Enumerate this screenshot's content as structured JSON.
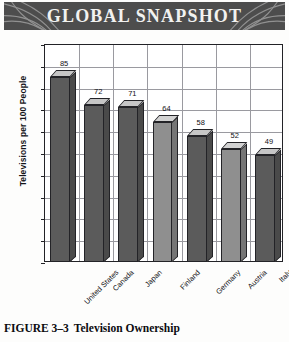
{
  "banner": {
    "title": "GLOBAL SNAPSHOT",
    "background_color": "#4d4d4d",
    "text_color": "#f2f2f0",
    "ornament": "swoosh-arcs"
  },
  "caption": {
    "number": "FIGURE 3–3",
    "title": "Television Ownership"
  },
  "chart_data": {
    "type": "bar",
    "title": "GLOBAL SNAPSHOT",
    "categories": [
      "United States",
      "Canada",
      "Japan",
      "Finland",
      "Germany",
      "Austria",
      "Italy"
    ],
    "values": [
      85,
      72,
      71,
      64,
      58,
      52,
      49
    ],
    "data_labels": [
      "85",
      "72",
      "71",
      "64",
      "58",
      "52",
      "49"
    ],
    "xlabel": "",
    "ylabel": "Televisions per 100 People",
    "ylim": [
      0,
      100
    ],
    "ytick_step": 10,
    "yticks": [
      "0",
      "10",
      "20",
      "30",
      "40",
      "50",
      "60",
      "70",
      "80",
      "90",
      "100"
    ],
    "grid": "both",
    "legend": "none",
    "style": "3d-columns",
    "bar_shades": [
      "dark",
      "dark",
      "dark",
      "light",
      "dark",
      "light",
      "dark"
    ],
    "colors": {
      "bar_dark": "#5b5b5b",
      "bar_light": "#8f8f8f",
      "bar_top": "#c9c9c9",
      "outline": "#232327",
      "grid": "#9a9aa0",
      "background": "#ffffff"
    }
  }
}
